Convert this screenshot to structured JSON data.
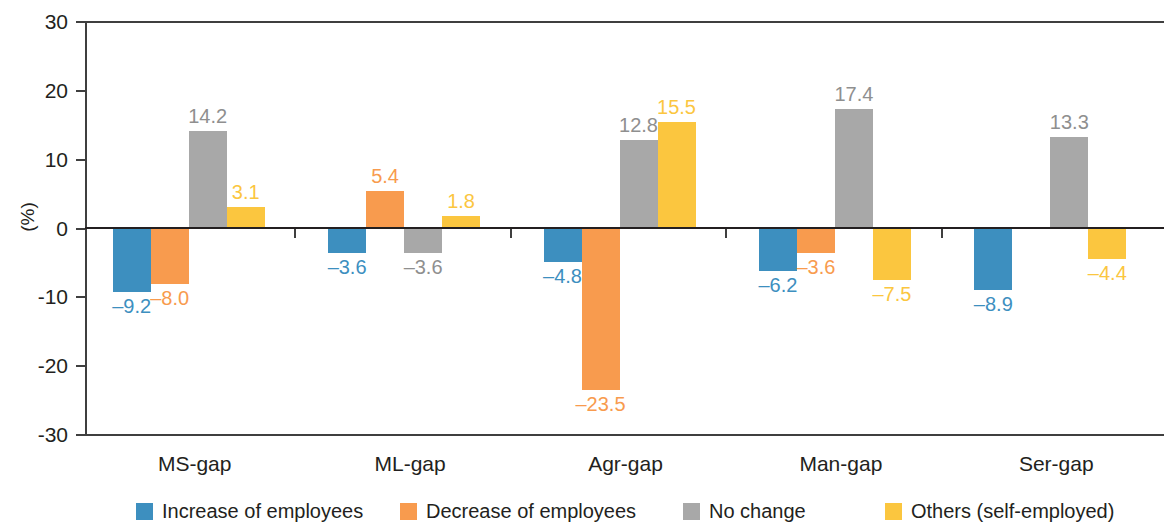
{
  "chart_data": {
    "type": "bar",
    "title": "",
    "subtitle": "",
    "xlabel": "",
    "ylabel": "(%)",
    "ylim": [
      -30,
      30
    ],
    "ytick_labels": [
      "30",
      "20",
      "10",
      "0",
      "-10",
      "-20",
      "-30"
    ],
    "ytick_values": [
      30,
      20,
      10,
      0,
      -10,
      -20,
      -30
    ],
    "grid": false,
    "legend_position": "bottom",
    "categories": [
      "MS-gap",
      "ML-gap",
      "Agr-gap",
      "Man-gap",
      "Ser-gap"
    ],
    "series": [
      {
        "name": "Increase of employees",
        "color": "#3d8fbf",
        "values": [
          -9.2,
          -3.6,
          -4.8,
          -6.2,
          -8.9
        ],
        "labels": [
          "–9.2",
          "–3.6",
          "–4.8",
          "–6.2",
          "–8.9"
        ]
      },
      {
        "name": "Decrease of employees",
        "color": "#f89b4e",
        "values": [
          -8.0,
          5.4,
          -23.5,
          -3.6,
          null
        ],
        "labels": [
          "–8.0",
          "5.4",
          "–23.5",
          "–3.6",
          ""
        ]
      },
      {
        "name": "No change",
        "color": "#a8a8a8",
        "values": [
          14.2,
          -3.6,
          12.8,
          17.4,
          13.3
        ],
        "labels": [
          "14.2",
          "–3.6",
          "12.8",
          "17.4",
          "13.3"
        ]
      },
      {
        "name": "Others (self-employed)",
        "color": "#fbc63f",
        "values": [
          3.1,
          1.8,
          15.5,
          -7.5,
          -4.4
        ],
        "labels": [
          "3.1",
          "1.8",
          "15.5",
          "–7.5",
          "–4.4"
        ]
      }
    ]
  },
  "legend": {
    "items": [
      {
        "label": "Increase of employees",
        "color": "#3d8fbf"
      },
      {
        "label": "Decrease of employees",
        "color": "#f89b4e"
      },
      {
        "label": "No change",
        "color": "#a8a8a8"
      },
      {
        "label": "Others (self-employed)",
        "color": "#fbc63f"
      }
    ]
  },
  "axis": {
    "y_title": "(%)"
  }
}
